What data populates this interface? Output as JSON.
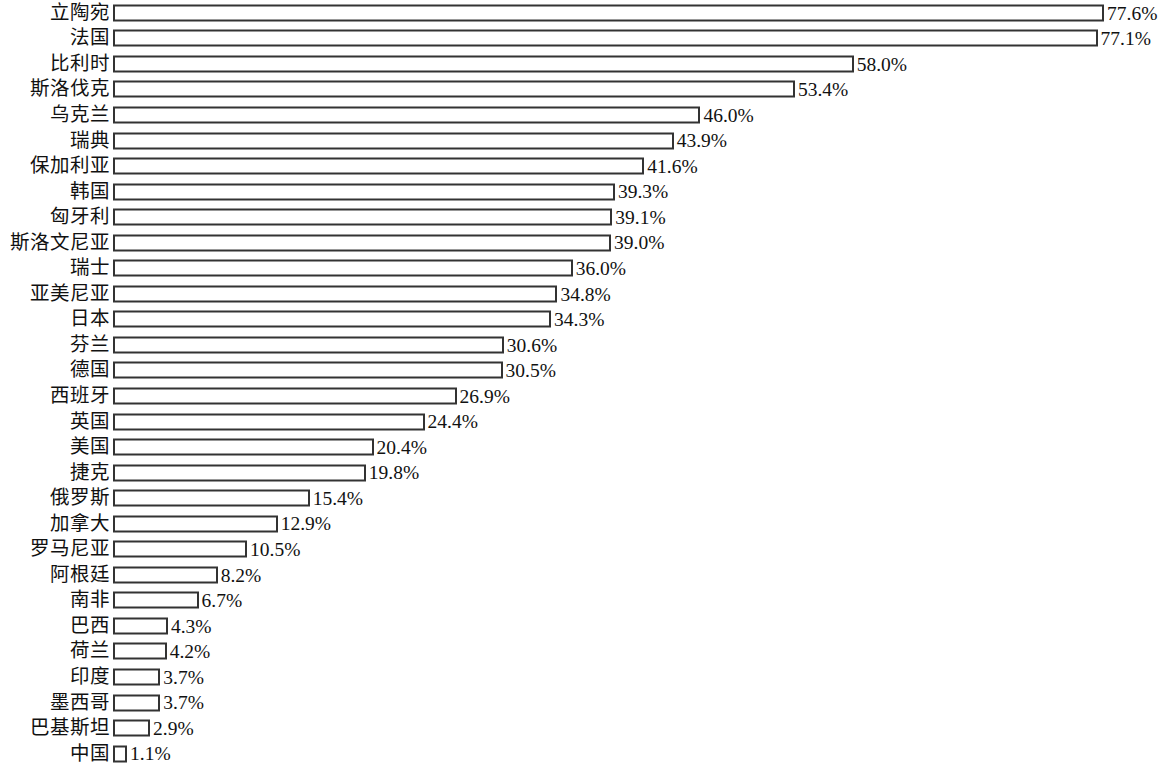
{
  "chart_data": {
    "type": "bar",
    "orientation": "horizontal",
    "title": "",
    "subtitle": "",
    "xlabel": "",
    "ylabel": "",
    "xlim": [
      0,
      77.6
    ],
    "grid": false,
    "legend": null,
    "value_suffix": "%",
    "categories": [
      "立陶宛",
      "法国",
      "比利时",
      "斯洛伐克",
      "乌克兰",
      "瑞典",
      "保加利亚",
      "韩国",
      "匈牙利",
      "斯洛文尼亚",
      "瑞士",
      "亚美尼亚",
      "日本",
      "芬兰",
      "德国",
      "西班牙",
      "英国",
      "美国",
      "捷克",
      "俄罗斯",
      "加拿大",
      "罗马尼亚",
      "阿根廷",
      "南非",
      "巴西",
      "荷兰",
      "印度",
      "墨西哥",
      "巴基斯坦",
      "中国"
    ],
    "values": [
      77.6,
      77.1,
      58.0,
      53.4,
      46.0,
      43.9,
      41.6,
      39.3,
      39.1,
      39.0,
      36.0,
      34.8,
      34.3,
      30.6,
      30.5,
      26.9,
      24.4,
      20.4,
      19.8,
      15.4,
      12.9,
      10.5,
      8.2,
      6.7,
      4.3,
      4.2,
      3.7,
      3.7,
      2.9,
      1.1
    ],
    "value_labels": [
      "77.6%",
      "77.1%",
      "58.0%",
      "53.4%",
      "46.0%",
      "43.9%",
      "41.6%",
      "39.3%",
      "39.1%",
      "39.0%",
      "36.0%",
      "34.8%",
      "34.3%",
      "30.6%",
      "30.5%",
      "26.9%",
      "24.4%",
      "20.4%",
      "19.8%",
      "15.4%",
      "12.9%",
      "10.5%",
      "8.2%",
      "6.7%",
      "4.3%",
      "4.2%",
      "3.7%",
      "3.7%",
      "2.9%",
      "1.1%"
    ],
    "bar_fill_color": "#ffffff",
    "bar_border_color": "#333333",
    "text_color": "#111111",
    "background_color": "#ffffff"
  }
}
